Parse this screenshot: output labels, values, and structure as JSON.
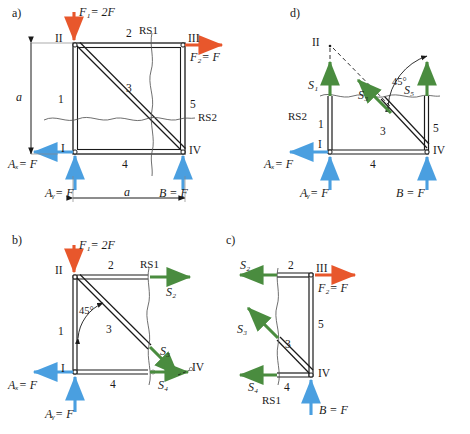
{
  "figure": {
    "kind": "statics-truss-free-body-diagrams",
    "colors": {
      "applied_force": "#E8572C",
      "reaction": "#4A9FE0",
      "member_force": "#4A8C3F",
      "structure": "#1a1a1a",
      "cut_line": "#555555"
    }
  },
  "panels": {
    "a": {
      "tag": "a)",
      "nodes": {
        "II": "II",
        "III": "III",
        "I": "I",
        "IV": "IV"
      },
      "members": {
        "m1": "1",
        "m2": "2",
        "m3": "3",
        "m4": "4",
        "m5": "5"
      },
      "cuts": {
        "rs1": "RS1",
        "rs2": "RS2"
      },
      "forces": {
        "f1": "F₁= 2F",
        "f2": "F₂= F",
        "ax": "Aₓ= F",
        "ay": "Aᵧ= F",
        "b": "B = F"
      },
      "dims": {
        "height": "a",
        "width": "a"
      }
    },
    "b": {
      "tag": "b)",
      "nodes": {
        "II": "II",
        "I": "I",
        "IV": "IV"
      },
      "members": {
        "m1": "1",
        "m2": "2",
        "m3": "3",
        "m4": "4"
      },
      "cuts": {
        "rs1": "RS1"
      },
      "angle": "45°",
      "forces": {
        "f1": "F₁= 2F",
        "ax": "Aₓ= F",
        "ay": "Aᵧ= F",
        "s2": "S₂",
        "s3": "S₃",
        "s4": "S₄"
      }
    },
    "c": {
      "tag": "c)",
      "nodes": {
        "III": "III",
        "IV": "IV"
      },
      "members": {
        "m2": "2",
        "m3": "3",
        "m4": "4",
        "m5": "5"
      },
      "cuts": {
        "rs1": "RS1"
      },
      "forces": {
        "f2": "F₂= F",
        "b": "B = F",
        "s2": "S₂",
        "s3": "S₃",
        "s4": "S₄"
      }
    },
    "d": {
      "tag": "d)",
      "nodes": {
        "II": "II",
        "I": "I",
        "IV": "IV"
      },
      "members": {
        "m1_upper": "1",
        "m1_lower": "1",
        "m3": "3",
        "m4": "4",
        "m5": "5"
      },
      "cuts": {
        "rs2": "RS2"
      },
      "angle": "45°",
      "forces": {
        "ax": "Aₓ= F",
        "ay": "Aᵧ= F",
        "b": "B = F",
        "s1": "S₁",
        "s3": "S₃",
        "s5": "S₅"
      }
    }
  }
}
